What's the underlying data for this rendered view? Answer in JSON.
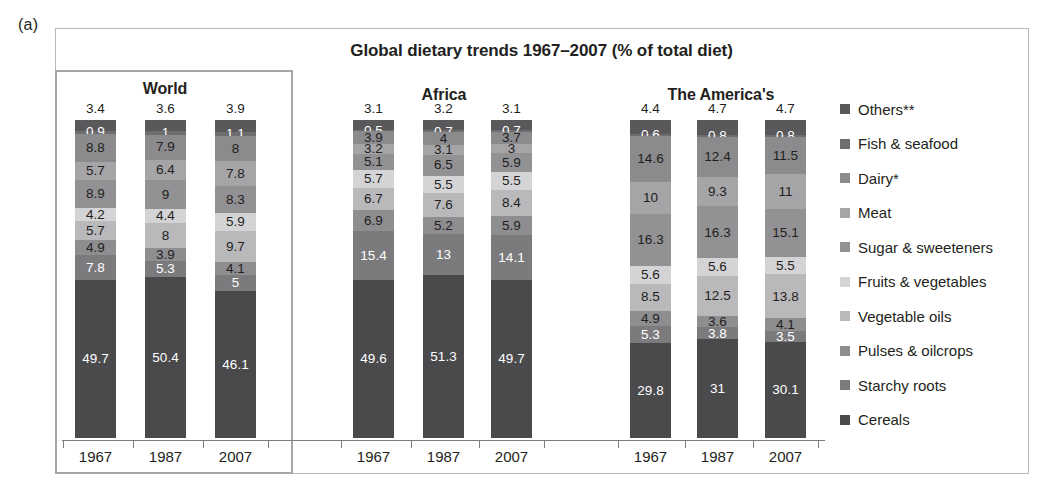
{
  "panel_label": "(a)",
  "title": "Global dietary trends 1967–2007 (% of total diet)",
  "years": [
    "1967",
    "1987",
    "2007"
  ],
  "groups": [
    {
      "name": "World"
    },
    {
      "name": "Africa"
    },
    {
      "name": "The America's"
    }
  ],
  "legend": {
    "items": [
      {
        "label": "Others**",
        "color": "#59585b"
      },
      {
        "label": "Fish & seafood",
        "color": "#6e6d70"
      },
      {
        "label": "Dairy*",
        "color": "#8b8a8d"
      },
      {
        "label": "Meat",
        "color": "#a5a4a7"
      },
      {
        "label": "Sugar & sweeteners",
        "color": "#929194"
      },
      {
        "label": "Fruits & vegetables",
        "color": "#d4d3d6"
      },
      {
        "label": "Vegetable oils",
        "color": "#b9b8bb"
      },
      {
        "label": "Pulses & oilcrops",
        "color": "#8e8d90"
      },
      {
        "label": "Starchy roots",
        "color": "#7b7a7d"
      },
      {
        "label": "Cereals",
        "color": "#4a494c"
      }
    ]
  },
  "chart_data": {
    "type": "bar",
    "subtype": "stacked-100-percent",
    "title": "Global dietary trends 1967–2007 (% of total diet)",
    "xlabel": "",
    "ylabel": "% of total diet",
    "ylim": [
      0,
      100
    ],
    "grid": false,
    "legend_position": "right",
    "categories": [
      "World 1967",
      "World 1987",
      "World 2007",
      "Africa 1967",
      "Africa 1987",
      "Africa 2007",
      "The America's 1967",
      "The America's 1987",
      "The America's 2007"
    ],
    "series": [
      {
        "name": "Cereals",
        "color": "#4a494c",
        "values": [
          49.7,
          50.4,
          46.1,
          49.6,
          51.3,
          49.7,
          29.8,
          31.0,
          30.1
        ]
      },
      {
        "name": "Starchy roots",
        "color": "#7b7a7d",
        "values": [
          7.8,
          5.3,
          5.0,
          15.4,
          13.0,
          14.1,
          5.3,
          3.8,
          3.5
        ]
      },
      {
        "name": "Pulses & oilcrops",
        "color": "#8e8d90",
        "values": [
          4.9,
          3.9,
          4.1,
          6.9,
          5.2,
          5.9,
          4.9,
          3.6,
          4.1
        ]
      },
      {
        "name": "Vegetable oils",
        "color": "#b9b8bb",
        "values": [
          5.7,
          8.0,
          9.7,
          6.7,
          7.6,
          8.4,
          8.5,
          12.5,
          13.8
        ]
      },
      {
        "name": "Fruits & vegetables",
        "color": "#d4d3d6",
        "values": [
          4.2,
          4.4,
          5.9,
          5.7,
          5.5,
          5.5,
          5.6,
          5.6,
          5.5
        ]
      },
      {
        "name": "Sugar & sweeteners",
        "color": "#929194",
        "values": [
          8.9,
          9.0,
          8.3,
          5.1,
          6.5,
          5.9,
          16.3,
          16.3,
          15.1
        ]
      },
      {
        "name": "Meat",
        "color": "#a5a4a7",
        "values": [
          5.7,
          6.4,
          7.8,
          3.2,
          3.1,
          3.0,
          10.0,
          9.3,
          11.0
        ]
      },
      {
        "name": "Dairy*",
        "color": "#8b8a8d",
        "values": [
          8.8,
          7.9,
          8.0,
          3.9,
          4.0,
          3.7,
          14.6,
          12.4,
          11.5
        ]
      },
      {
        "name": "Fish & seafood",
        "color": "#6e6d70",
        "values": [
          0.9,
          1.0,
          1.1,
          0.5,
          0.7,
          0.7,
          0.6,
          0.8,
          0.8
        ]
      },
      {
        "name": "Others**",
        "color": "#59585b",
        "values": [
          3.4,
          3.6,
          3.9,
          3.1,
          3.2,
          3.1,
          4.4,
          4.7,
          4.7
        ]
      }
    ],
    "bars": [
      {
        "group": "World",
        "year": "1967",
        "top_label": "3.4",
        "stack": [
          {
            "name": "Others**",
            "value": "3.4",
            "inside": false
          },
          {
            "name": "Fish & seafood",
            "value": "0.9",
            "inside": true,
            "light": true
          },
          {
            "name": "Dairy*",
            "value": "8.8",
            "inside": true,
            "light": false
          },
          {
            "name": "Meat",
            "value": "5.7",
            "inside": true,
            "light": false
          },
          {
            "name": "Sugar & sweeteners",
            "value": "8.9",
            "inside": true,
            "light": false
          },
          {
            "name": "Fruits & vegetables",
            "value": "4.2",
            "inside": true,
            "light": false
          },
          {
            "name": "Vegetable oils",
            "value": "5.7",
            "inside": true,
            "light": false
          },
          {
            "name": "Pulses & oilcrops",
            "value": "4.9",
            "inside": true,
            "light": false
          },
          {
            "name": "Starchy roots",
            "value": "7.8",
            "inside": true,
            "light": true
          },
          {
            "name": "Cereals",
            "value": "49.7",
            "inside": true,
            "light": true
          }
        ]
      },
      {
        "group": "World",
        "year": "1987",
        "top_label": "3.6",
        "stack": [
          {
            "name": "Others**",
            "value": "3.6",
            "inside": false
          },
          {
            "name": "Fish & seafood",
            "value": "1",
            "inside": true,
            "light": true
          },
          {
            "name": "Dairy*",
            "value": "7.9",
            "inside": true,
            "light": false
          },
          {
            "name": "Meat",
            "value": "6.4",
            "inside": true,
            "light": false
          },
          {
            "name": "Sugar & sweeteners",
            "value": "9",
            "inside": true,
            "light": false
          },
          {
            "name": "Fruits & vegetables",
            "value": "4.4",
            "inside": true,
            "light": false
          },
          {
            "name": "Vegetable oils",
            "value": "8",
            "inside": true,
            "light": false
          },
          {
            "name": "Pulses & oilcrops",
            "value": "3.9",
            "inside": true,
            "light": false
          },
          {
            "name": "Starchy roots",
            "value": "5.3",
            "inside": true,
            "light": true
          },
          {
            "name": "Cereals",
            "value": "50.4",
            "inside": true,
            "light": true
          }
        ]
      },
      {
        "group": "World",
        "year": "2007",
        "top_label": "3.9",
        "stack": [
          {
            "name": "Others**",
            "value": "3.9",
            "inside": false
          },
          {
            "name": "Fish & seafood",
            "value": "1.1",
            "inside": true,
            "light": true
          },
          {
            "name": "Dairy*",
            "value": "8",
            "inside": true,
            "light": false
          },
          {
            "name": "Meat",
            "value": "7.8",
            "inside": true,
            "light": false
          },
          {
            "name": "Sugar & sweeteners",
            "value": "8.3",
            "inside": true,
            "light": false
          },
          {
            "name": "Fruits & vegetables",
            "value": "5.9",
            "inside": true,
            "light": false
          },
          {
            "name": "Vegetable oils",
            "value": "9.7",
            "inside": true,
            "light": false
          },
          {
            "name": "Pulses & oilcrops",
            "value": "4.1",
            "inside": true,
            "light": false
          },
          {
            "name": "Starchy roots",
            "value": "5",
            "inside": true,
            "light": true
          },
          {
            "name": "Cereals",
            "value": "46.1",
            "inside": true,
            "light": true
          }
        ]
      },
      {
        "group": "Africa",
        "year": "1967",
        "top_label": "3.1",
        "stack": [
          {
            "name": "Others**",
            "value": "3.1",
            "inside": false
          },
          {
            "name": "Fish & seafood",
            "value": "0.5",
            "inside": true,
            "light": true
          },
          {
            "name": "Dairy*",
            "value": "3.9",
            "inside": true,
            "light": false
          },
          {
            "name": "Meat",
            "value": "3.2",
            "inside": true,
            "light": false
          },
          {
            "name": "Sugar & sweeteners",
            "value": "5.1",
            "inside": true,
            "light": false
          },
          {
            "name": "Fruits & vegetables",
            "value": "5.7",
            "inside": true,
            "light": false
          },
          {
            "name": "Vegetable oils",
            "value": "6.7",
            "inside": true,
            "light": false
          },
          {
            "name": "Pulses & oilcrops",
            "value": "6.9",
            "inside": true,
            "light": false
          },
          {
            "name": "Starchy roots",
            "value": "15.4",
            "inside": true,
            "light": true
          },
          {
            "name": "Cereals",
            "value": "49.6",
            "inside": true,
            "light": true
          }
        ]
      },
      {
        "group": "Africa",
        "year": "1987",
        "top_label": "3.2",
        "stack": [
          {
            "name": "Others**",
            "value": "3.2",
            "inside": false
          },
          {
            "name": "Fish & seafood",
            "value": "0.7",
            "inside": true,
            "light": true
          },
          {
            "name": "Dairy*",
            "value": "4",
            "inside": true,
            "light": false
          },
          {
            "name": "Meat",
            "value": "3.1",
            "inside": true,
            "light": false
          },
          {
            "name": "Sugar & sweeteners",
            "value": "6.5",
            "inside": true,
            "light": false
          },
          {
            "name": "Fruits & vegetables",
            "value": "5.5",
            "inside": true,
            "light": false
          },
          {
            "name": "Vegetable oils",
            "value": "7.6",
            "inside": true,
            "light": false
          },
          {
            "name": "Pulses & oilcrops",
            "value": "5.2",
            "inside": true,
            "light": false
          },
          {
            "name": "Starchy roots",
            "value": "13",
            "inside": true,
            "light": true
          },
          {
            "name": "Cereals",
            "value": "51.3",
            "inside": true,
            "light": true
          }
        ]
      },
      {
        "group": "Africa",
        "year": "2007",
        "top_label": "3.1",
        "stack": [
          {
            "name": "Others**",
            "value": "3.1",
            "inside": false
          },
          {
            "name": "Fish & seafood",
            "value": "0.7",
            "inside": true,
            "light": true
          },
          {
            "name": "Dairy*",
            "value": "3.7",
            "inside": true,
            "light": false
          },
          {
            "name": "Meat",
            "value": "3",
            "inside": true,
            "light": false
          },
          {
            "name": "Sugar & sweeteners",
            "value": "5.9",
            "inside": true,
            "light": false
          },
          {
            "name": "Fruits & vegetables",
            "value": "5.5",
            "inside": true,
            "light": false
          },
          {
            "name": "Vegetable oils",
            "value": "8.4",
            "inside": true,
            "light": false
          },
          {
            "name": "Pulses & oilcrops",
            "value": "5.9",
            "inside": true,
            "light": false
          },
          {
            "name": "Starchy roots",
            "value": "14.1",
            "inside": true,
            "light": true
          },
          {
            "name": "Cereals",
            "value": "49.7",
            "inside": true,
            "light": true
          }
        ]
      },
      {
        "group": "The America's",
        "year": "1967",
        "top_label": "4.4",
        "stack": [
          {
            "name": "Others**",
            "value": "4.4",
            "inside": false
          },
          {
            "name": "Fish & seafood",
            "value": "0.6",
            "inside": true,
            "light": true
          },
          {
            "name": "Dairy*",
            "value": "14.6",
            "inside": true,
            "light": false
          },
          {
            "name": "Meat",
            "value": "10",
            "inside": true,
            "light": false
          },
          {
            "name": "Sugar & sweeteners",
            "value": "16.3",
            "inside": true,
            "light": false
          },
          {
            "name": "Fruits & vegetables",
            "value": "5.6",
            "inside": true,
            "light": false
          },
          {
            "name": "Vegetable oils",
            "value": "8.5",
            "inside": true,
            "light": false
          },
          {
            "name": "Pulses & oilcrops",
            "value": "4.9",
            "inside": true,
            "light": false
          },
          {
            "name": "Starchy roots",
            "value": "5.3",
            "inside": true,
            "light": true
          },
          {
            "name": "Cereals",
            "value": "29.8",
            "inside": true,
            "light": true
          }
        ]
      },
      {
        "group": "The America's",
        "year": "1987",
        "top_label": "4.7",
        "stack": [
          {
            "name": "Others**",
            "value": "4.7",
            "inside": false
          },
          {
            "name": "Fish & seafood",
            "value": "0.8",
            "inside": true,
            "light": true
          },
          {
            "name": "Dairy*",
            "value": "12.4",
            "inside": true,
            "light": false
          },
          {
            "name": "Meat",
            "value": "9.3",
            "inside": true,
            "light": false
          },
          {
            "name": "Sugar & sweeteners",
            "value": "16.3",
            "inside": true,
            "light": false
          },
          {
            "name": "Fruits & vegetables",
            "value": "5.6",
            "inside": true,
            "light": false
          },
          {
            "name": "Vegetable oils",
            "value": "12.5",
            "inside": true,
            "light": false
          },
          {
            "name": "Pulses & oilcrops",
            "value": "3.6",
            "inside": true,
            "light": false
          },
          {
            "name": "Starchy roots",
            "value": "3.8",
            "inside": true,
            "light": true
          },
          {
            "name": "Cereals",
            "value": "31",
            "inside": true,
            "light": true
          }
        ]
      },
      {
        "group": "The America's",
        "year": "2007",
        "top_label": "4.7",
        "stack": [
          {
            "name": "Others**",
            "value": "4.7",
            "inside": false
          },
          {
            "name": "Fish & seafood",
            "value": "0.8",
            "inside": true,
            "light": true
          },
          {
            "name": "Dairy*",
            "value": "11.5",
            "inside": true,
            "light": false
          },
          {
            "name": "Meat",
            "value": "11",
            "inside": true,
            "light": false
          },
          {
            "name": "Sugar & sweeteners",
            "value": "15.1",
            "inside": true,
            "light": false
          },
          {
            "name": "Fruits & vegetables",
            "value": "5.5",
            "inside": true,
            "light": false
          },
          {
            "name": "Vegetable oils",
            "value": "13.8",
            "inside": true,
            "light": false
          },
          {
            "name": "Pulses & oilcrops",
            "value": "4.1",
            "inside": true,
            "light": false
          },
          {
            "name": "Starchy roots",
            "value": "3.5",
            "inside": true,
            "light": true
          },
          {
            "name": "Cereals",
            "value": "30.1",
            "inside": true,
            "light": true
          }
        ]
      }
    ]
  }
}
